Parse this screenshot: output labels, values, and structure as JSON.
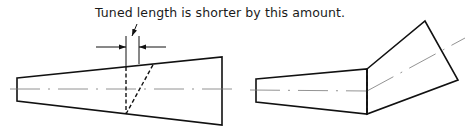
{
  "caption": {
    "text": "Tuned length is shorter by this amount."
  },
  "figures": [
    {
      "name": "straight-tapered-waveguide",
      "description": "Tapered section with straight joint and angled hidden cut showing shorter tuned length"
    },
    {
      "name": "bent-tapered-waveguide",
      "description": "Tapered section joined to angled flared section at a bend"
    }
  ],
  "colors": {
    "line": "#111111",
    "centerline": "#777777",
    "background": "#ffffff"
  }
}
